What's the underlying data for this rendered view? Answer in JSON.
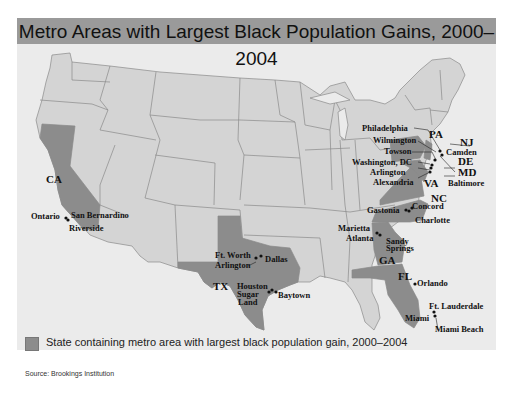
{
  "title": "Metro Areas with Largest Black Population Gains, 2000–2004",
  "colors": {
    "title_bar": "#9a9a9a",
    "background": "#ebebeb",
    "state_default": "#d4d4d4",
    "state_highlight": "#8c8c8c",
    "border": "#8a8a8a"
  },
  "highlighted_states": [
    "CA",
    "TX",
    "GA",
    "FL",
    "NC",
    "VA",
    "MD",
    "DE",
    "PA",
    "NJ"
  ],
  "state_labels": {
    "CA": "CA",
    "TX": "TX",
    "GA": "GA",
    "FL": "FL",
    "NC": "NC",
    "VA": "VA",
    "PA": "PA",
    "NJ": "NJ",
    "DE": "DE",
    "MD": "MD"
  },
  "metros": {
    "ontario": "Ontario",
    "san_bernardino": "San Bernardino",
    "riverside": "Riverside",
    "ft_worth": "Ft. Worth",
    "arlington_tx": "Arlington",
    "dallas": "Dallas",
    "houston": "Houston",
    "sugar": "Sugar",
    "land": "Land",
    "baytown": "Baytown",
    "marietta": "Marietta",
    "atlanta": "Atlanta",
    "sandy": "Sandy",
    "springs": "Springs",
    "orlando": "Orlando",
    "ft_lauderdale": "Ft. Lauderdale",
    "miami": "Miami",
    "miami_beach": "Miami Beach",
    "gastonia": "Gastonia",
    "concord": "Concord",
    "charlotte": "Charlotte",
    "philadelphia": "Philadelphia",
    "wilmington": "Wilmington",
    "towson": "Towson",
    "washington_dc": "Washington, DC",
    "arlington_va": "Arlington",
    "alexandria": "Alexandria",
    "camden": "Camden",
    "baltimore": "Baltimore"
  },
  "legend": {
    "label": "State containing metro area with largest black population gain, 2000–2004"
  },
  "source": "Source: Brookings Institution"
}
